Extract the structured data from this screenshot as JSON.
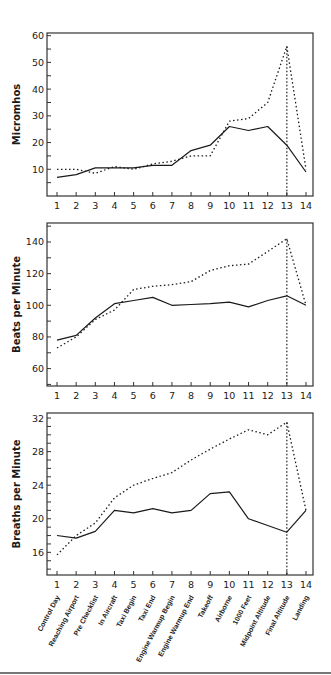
{
  "chart_data": [
    {
      "type": "line",
      "title": "",
      "xlabel": "",
      "ylabel": "Micromhos",
      "x": [
        1,
        2,
        3,
        4,
        5,
        6,
        7,
        8,
        9,
        10,
        11,
        12,
        13,
        14
      ],
      "yticks": [
        10,
        20,
        30,
        40,
        50,
        60
      ],
      "ylim": [
        0,
        61
      ],
      "minor_tick_step": 5,
      "series": [
        {
          "name": "solid",
          "style": "solid",
          "values": [
            7,
            8,
            10.5,
            10.5,
            10.5,
            11.5,
            11.5,
            17,
            19,
            26,
            24.5,
            26,
            19,
            9
          ]
        },
        {
          "name": "dotted",
          "style": "dotted",
          "values": [
            10,
            10,
            8.5,
            11,
            10,
            12,
            13,
            15,
            15,
            28,
            29,
            35,
            56,
            10
          ]
        }
      ],
      "vertical_marker_x": 13,
      "grid": false,
      "legend": "none"
    },
    {
      "type": "line",
      "title": "",
      "xlabel": "",
      "ylabel": "Beats per Minute",
      "x": [
        1,
        2,
        3,
        4,
        5,
        6,
        7,
        8,
        9,
        10,
        11,
        12,
        13,
        14
      ],
      "yticks": [
        60,
        80,
        100,
        120,
        140
      ],
      "ylim": [
        49,
        152
      ],
      "minor_tick_step": 10,
      "series": [
        {
          "name": "solid",
          "style": "solid",
          "values": [
            78,
            81,
            92,
            101,
            103,
            105,
            100,
            100.5,
            101,
            102,
            99,
            103,
            106,
            100
          ]
        },
        {
          "name": "dotted",
          "style": "dotted",
          "values": [
            73,
            80,
            91,
            97,
            110,
            112,
            113,
            115,
            122,
            125,
            126,
            134,
            142,
            100
          ]
        }
      ],
      "vertical_marker_x": 13,
      "grid": false,
      "legend": "none"
    },
    {
      "type": "line",
      "title": "",
      "xlabel": "",
      "ylabel": "Breaths per Minute",
      "x": [
        1,
        2,
        3,
        4,
        5,
        6,
        7,
        8,
        9,
        10,
        11,
        12,
        13,
        14
      ],
      "yticks": [
        16,
        20,
        24,
        28,
        32
      ],
      "ylim": [
        13.3,
        32.6
      ],
      "minor_tick_step": 1,
      "series": [
        {
          "name": "solid",
          "style": "solid",
          "values": [
            18,
            17.7,
            18.5,
            21,
            20.7,
            21.2,
            20.7,
            21,
            23,
            23.2,
            20,
            19.2,
            18.4,
            21
          ]
        },
        {
          "name": "dotted",
          "style": "dotted",
          "values": [
            15.7,
            18,
            19.5,
            22.5,
            24,
            24.8,
            25.5,
            27,
            28.3,
            29.5,
            30.6,
            30,
            31.5,
            21
          ]
        }
      ],
      "vertical_marker_x": 13,
      "grid": false,
      "legend": "none",
      "category_labels": [
        "Control Day",
        "Reaching Airport",
        "Pre Checklist",
        "In Aircraft",
        "Taxi Begin",
        "Taxi End",
        "Engine Warmup Begin",
        "Engine Warmup End",
        "Takeoff",
        "Airborne",
        "1000 Feet",
        "Midpoint Altitude",
        "Final Altitude",
        "Landing"
      ]
    }
  ],
  "layout": {
    "panels": [
      {
        "left": 47,
        "right": 313,
        "top": 33,
        "bottom": 196
      },
      {
        "left": 47,
        "right": 313,
        "top": 223,
        "bottom": 386
      },
      {
        "left": 47,
        "right": 313,
        "top": 413,
        "bottom": 575
      }
    ],
    "x_first_px": 57,
    "x_last_px": 306,
    "line_color": "#1a1a1a",
    "frame_color": "#333333"
  }
}
